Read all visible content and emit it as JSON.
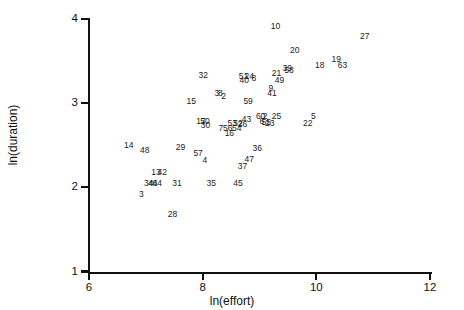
{
  "chart_data": {
    "type": "scatter",
    "title": "",
    "xlabel": "ln(effort)",
    "ylabel": "ln(duration)",
    "xlim": [
      6,
      12
    ],
    "ylim": [
      1,
      4
    ],
    "xticks": [
      6,
      8,
      10,
      12
    ],
    "yticks": [
      1,
      2,
      3,
      4
    ],
    "grid": false,
    "legend": "none",
    "point_label_style": "numeric-id",
    "points": [
      {
        "label": "10",
        "x": 9.28,
        "y": 3.92
      },
      {
        "label": "27",
        "x": 10.85,
        "y": 3.8
      },
      {
        "label": "20",
        "x": 9.62,
        "y": 3.63
      },
      {
        "label": "19",
        "x": 10.35,
        "y": 3.53
      },
      {
        "label": "18",
        "x": 10.06,
        "y": 3.45
      },
      {
        "label": "63",
        "x": 10.46,
        "y": 3.45
      },
      {
        "label": "39",
        "x": 9.49,
        "y": 3.42
      },
      {
        "label": "58",
        "x": 9.52,
        "y": 3.39
      },
      {
        "label": "21",
        "x": 9.3,
        "y": 3.36
      },
      {
        "label": "32",
        "x": 8.01,
        "y": 3.33
      },
      {
        "label": "51",
        "x": 8.72,
        "y": 3.32
      },
      {
        "label": "24",
        "x": 8.82,
        "y": 3.32
      },
      {
        "label": "8",
        "x": 8.9,
        "y": 3.3
      },
      {
        "label": "40",
        "x": 8.73,
        "y": 3.27
      },
      {
        "label": "49",
        "x": 9.35,
        "y": 3.27
      },
      {
        "label": "9",
        "x": 9.2,
        "y": 3.18
      },
      {
        "label": "41",
        "x": 9.22,
        "y": 3.12
      },
      {
        "label": "3",
        "x": 8.25,
        "y": 3.12
      },
      {
        "label": "8b",
        "x": 8.31,
        "y": 3.12
      },
      {
        "label": "2",
        "x": 8.37,
        "y": 3.09
      },
      {
        "label": "15",
        "x": 7.8,
        "y": 3.03
      },
      {
        "label": "59",
        "x": 8.8,
        "y": 3.03
      },
      {
        "label": "60",
        "x": 9.02,
        "y": 2.85
      },
      {
        "label": "2b",
        "x": 9.1,
        "y": 2.85
      },
      {
        "label": "25",
        "x": 9.3,
        "y": 2.85
      },
      {
        "label": "5",
        "x": 9.95,
        "y": 2.85
      },
      {
        "label": "6",
        "x": 9.04,
        "y": 2.79
      },
      {
        "label": "55",
        "x": 9.12,
        "y": 2.78
      },
      {
        "label": "23",
        "x": 9.18,
        "y": 2.76
      },
      {
        "label": "22",
        "x": 9.85,
        "y": 2.76
      },
      {
        "label": "43",
        "x": 8.77,
        "y": 2.81
      },
      {
        "label": "53",
        "x": 8.52,
        "y": 2.76
      },
      {
        "label": "52",
        "x": 8.62,
        "y": 2.76
      },
      {
        "label": "26",
        "x": 8.7,
        "y": 2.75
      },
      {
        "label": "17",
        "x": 7.97,
        "y": 2.79
      },
      {
        "label": "50",
        "x": 8.04,
        "y": 2.79
      },
      {
        "label": "30",
        "x": 8.05,
        "y": 2.74
      },
      {
        "label": "7",
        "x": 8.32,
        "y": 2.7
      },
      {
        "label": "56",
        "x": 8.44,
        "y": 2.7
      },
      {
        "label": "54",
        "x": 8.6,
        "y": 2.7
      },
      {
        "label": "16",
        "x": 8.47,
        "y": 2.64
      },
      {
        "label": "14",
        "x": 6.7,
        "y": 2.5
      },
      {
        "label": "48",
        "x": 6.98,
        "y": 2.44
      },
      {
        "label": "29",
        "x": 7.61,
        "y": 2.48
      },
      {
        "label": "57",
        "x": 7.92,
        "y": 2.41
      },
      {
        "label": "36",
        "x": 8.96,
        "y": 2.47
      },
      {
        "label": "47",
        "x": 8.82,
        "y": 2.34
      },
      {
        "label": "4",
        "x": 8.04,
        "y": 2.33
      },
      {
        "label": "37",
        "x": 8.7,
        "y": 2.25
      },
      {
        "label": "13",
        "x": 7.18,
        "y": 2.18
      },
      {
        "label": "42",
        "x": 7.29,
        "y": 2.18
      },
      {
        "label": "34",
        "x": 7.05,
        "y": 2.05
      },
      {
        "label": "44",
        "x": 7.12,
        "y": 2.05
      },
      {
        "label": "64",
        "x": 7.2,
        "y": 2.05
      },
      {
        "label": "31",
        "x": 7.55,
        "y": 2.05
      },
      {
        "label": "35",
        "x": 8.15,
        "y": 2.05
      },
      {
        "label": "45",
        "x": 8.62,
        "y": 2.05
      },
      {
        "label": "3b",
        "x": 6.92,
        "y": 1.92
      },
      {
        "label": "28",
        "x": 7.47,
        "y": 1.68
      }
    ]
  },
  "axes": {
    "x": {
      "label": "ln(effort)",
      "ticks": [
        "6",
        "8",
        "10",
        "12"
      ]
    },
    "y": {
      "label": "ln(duration)",
      "ticks": [
        "1",
        "2",
        "3",
        "4"
      ]
    }
  },
  "point_labels": [
    "10",
    "27",
    "20",
    "19",
    "18",
    "63",
    "39",
    "58",
    "21",
    "32",
    "51",
    "24",
    "8",
    "40",
    "49",
    "9",
    "41",
    "3",
    "8b",
    "2",
    "15",
    "59",
    "60",
    "2b",
    "25",
    "5",
    "6",
    "55",
    "23",
    "22",
    "43",
    "53",
    "52",
    "26",
    "17",
    "50",
    "30",
    "7",
    "56",
    "54",
    "16",
    "14",
    "48",
    "29",
    "57",
    "36",
    "47",
    "4",
    "37",
    "13",
    "42",
    "34",
    "44",
    "64",
    "31",
    "35",
    "45",
    "3b",
    "28"
  ]
}
